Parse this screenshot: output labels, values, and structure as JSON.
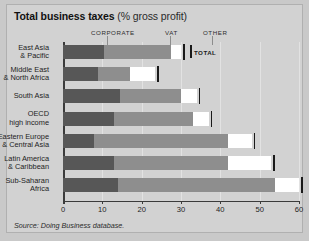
{
  "title": {
    "main": "Total business taxes",
    "unit": "(% gross profit)"
  },
  "source": "Source: Doing Business database.",
  "legend": {
    "items": [
      {
        "key": "corporate",
        "label": "CORPORATE",
        "color": "#575757"
      },
      {
        "key": "vat",
        "label": "VAT",
        "color": "#8e8e8e"
      },
      {
        "key": "other",
        "label": "OTHER",
        "color": "#ffffff"
      }
    ],
    "total_label": "TOTAL",
    "total_color": "#1a1a1a"
  },
  "chart_data": {
    "type": "bar",
    "orientation": "horizontal",
    "stacked": true,
    "title": "Total business taxes (% gross profit)",
    "xlabel": "",
    "ylabel": "",
    "xlim": [
      0,
      60
    ],
    "xticks": [
      0,
      10,
      20,
      30,
      40,
      50,
      60
    ],
    "xticklabels": [
      "0",
      "10",
      "20",
      "30",
      "40",
      "50",
      "60"
    ],
    "grid": "vertical",
    "legend_position": "top",
    "categories": [
      "East Asia\n& Pacific",
      "Middle East\n& North Africa",
      "South Asia",
      "OECD\nhigh income",
      "Eastern Europe\n& Central Asia",
      "Latin America\n& Caribbean",
      "Sub-Saharan\nAfrica"
    ],
    "category_lines": [
      [
        "East Asia",
        "& Pacific"
      ],
      [
        "Middle East",
        "& North Africa"
      ],
      [
        "South Asia"
      ],
      [
        "OECD",
        "high income"
      ],
      [
        "Eastern Europe",
        "& Central Asia"
      ],
      [
        "Latin America",
        "& Caribbean"
      ],
      [
        "Sub-Saharan",
        "Africa"
      ]
    ],
    "series": [
      {
        "name": "CORPORATE",
        "color": "#575757",
        "values": [
          10.5,
          9.0,
          14.5,
          13.0,
          8.0,
          13.0,
          14.0
        ]
      },
      {
        "name": "VAT",
        "color": "#8e8e8e",
        "values": [
          17.0,
          8.0,
          15.5,
          20.0,
          34.0,
          29.0,
          40.0
        ]
      },
      {
        "name": "OTHER",
        "color": "#ffffff",
        "values": [
          2.5,
          6.5,
          4.0,
          4.0,
          6.0,
          11.0,
          6.0
        ]
      }
    ],
    "totals": [
      30.0,
      23.5,
      34.0,
      37.0,
      48.0,
      53.0,
      60.0
    ]
  }
}
